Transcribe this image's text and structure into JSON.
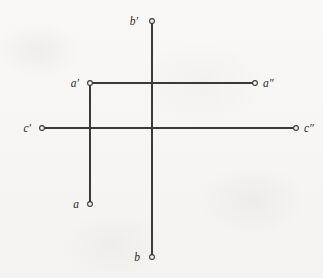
{
  "figure": {
    "background_color": "#f6f5f3",
    "line_color": "#3a3a3a",
    "marker_fill": "#f6f5f3",
    "label_color": "#2b2b2b",
    "width": 323,
    "height": 278
  },
  "axes": {
    "horizontal": {
      "name": "c-axis",
      "y": 128,
      "x_start": 42,
      "x_end": 296
    },
    "vertical": {
      "name": "b-axis",
      "x": 152,
      "y_start": 21,
      "y_end": 257
    },
    "origin": {
      "x": 152,
      "y": 128
    }
  },
  "segments": [
    {
      "name": "a-prime-to-a-double-prime",
      "orientation": "horizontal",
      "y": 83,
      "x_start": 90,
      "x_end": 255
    },
    {
      "name": "a-prime-to-a",
      "orientation": "vertical",
      "x": 90,
      "y_start": 83,
      "y_end": 204
    }
  ],
  "points": [
    {
      "id": "b-prime",
      "label": "b′",
      "x": 152,
      "y": 21,
      "label_x": 138,
      "label_y": 25,
      "anchor": "end"
    },
    {
      "id": "a-prime",
      "label": "a′",
      "x": 90,
      "y": 83,
      "label_x": 79,
      "label_y": 87,
      "anchor": "end"
    },
    {
      "id": "a-double-prime",
      "label": "a″",
      "x": 255,
      "y": 83,
      "label_x": 263,
      "label_y": 87,
      "anchor": "start"
    },
    {
      "id": "c-prime",
      "label": "c′",
      "x": 42,
      "y": 128,
      "label_x": 31,
      "label_y": 132,
      "anchor": "end"
    },
    {
      "id": "c-double-prime",
      "label": "c″",
      "x": 296,
      "y": 128,
      "label_x": 304,
      "label_y": 132,
      "anchor": "start"
    },
    {
      "id": "a",
      "label": "a",
      "x": 90,
      "y": 204,
      "label_x": 79,
      "label_y": 208,
      "anchor": "end"
    },
    {
      "id": "b",
      "label": "b",
      "x": 152,
      "y": 257,
      "label_x": 140,
      "label_y": 261,
      "anchor": "end"
    }
  ],
  "marker": {
    "radius": 2.4,
    "stroke_width": 1.1
  }
}
